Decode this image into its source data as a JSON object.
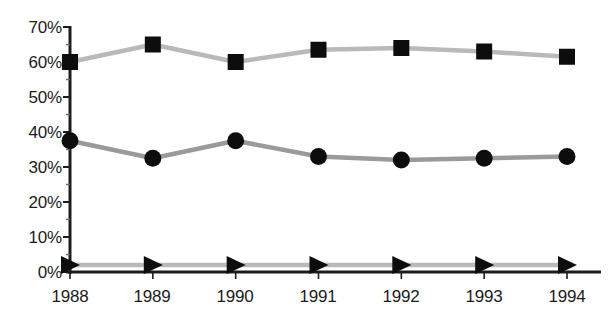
{
  "chart_data": {
    "type": "line",
    "title": "",
    "subtitle": "",
    "xlabel": "",
    "ylabel": "",
    "categories": [
      "1988",
      "1989",
      "1990",
      "1991",
      "1992",
      "1993",
      "1994"
    ],
    "x": [
      1988,
      1989,
      1990,
      1991,
      1992,
      1993,
      1994
    ],
    "ylim": [
      0,
      70
    ],
    "xlim": [
      1988,
      1994
    ],
    "ytick_labels": [
      "0%",
      "10%",
      "20%",
      "30%",
      "40%",
      "50%",
      "60%",
      "70%"
    ],
    "ytick_values": [
      0,
      10,
      20,
      30,
      40,
      50,
      60,
      70
    ],
    "grid": false,
    "legend": "none",
    "series": [
      {
        "name": "series-squares",
        "marker": "square",
        "color": "#b9b9b9",
        "marker_color": "#0d0d0d",
        "values": [
          60,
          65,
          60,
          63.5,
          64,
          63,
          61.5
        ]
      },
      {
        "name": "series-circles",
        "marker": "circle",
        "color": "#9a9a9a",
        "marker_color": "#0d0d0d",
        "values": [
          37.5,
          32.5,
          37.5,
          33,
          32,
          32.5,
          33
        ]
      },
      {
        "name": "series-triangles",
        "marker": "triangle-right",
        "color": "#b9b9b9",
        "marker_color": "#0d0d0d",
        "values": [
          2,
          2,
          2,
          2,
          2,
          2,
          2
        ]
      }
    ],
    "axis_color": "#1c1c1c"
  },
  "yticks": [
    {
      "label": "70%"
    },
    {
      "label": "60%"
    },
    {
      "label": "50%"
    },
    {
      "label": "40%"
    },
    {
      "label": "30%"
    },
    {
      "label": "20%"
    },
    {
      "label": "10%"
    },
    {
      "label": "0%"
    }
  ],
  "xticks": [
    {
      "label": "1988"
    },
    {
      "label": "1989"
    },
    {
      "label": "1990"
    },
    {
      "label": "1991"
    },
    {
      "label": "1992"
    },
    {
      "label": "1993"
    },
    {
      "label": "1994"
    }
  ]
}
